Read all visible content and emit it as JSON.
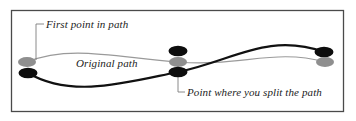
{
  "figure": {
    "name": "path-split-illustration",
    "background_color": "#ffffff",
    "border_color": "#4a4a4a",
    "border": {
      "x": 11,
      "y": 10,
      "width": 333,
      "height": 102
    }
  },
  "annotations": [
    {
      "id": "first-point",
      "text": "First point in path",
      "x": 46,
      "y": 18,
      "leader": "elbow-down-left",
      "points_to": "start-anchor-gray"
    },
    {
      "id": "original-path",
      "text": "Original path",
      "x": 76,
      "y": 57,
      "leader": "none",
      "points_to": "gray-path"
    },
    {
      "id": "split-point",
      "text": "Point where you split the path",
      "x": 187,
      "y": 86,
      "leader": "elbow-up-left",
      "points_to": "split-anchor-black"
    }
  ],
  "paths": [
    {
      "id": "gray-path",
      "label": "Original path",
      "color": "#9a9a9a",
      "stroke_width": 1.1,
      "description": "thin light-gray S-curve running above the black curve on the left half and below it on the right half"
    },
    {
      "id": "black-path",
      "label": "Split path",
      "color": "#111111",
      "stroke_width": 2.1,
      "description": "thick black S-curve running below the gray curve on the left half and above it on the right half"
    }
  ],
  "anchors": [
    {
      "id": "start-anchor-gray",
      "cx": 27,
      "cy": 62,
      "rx": 9,
      "ry": 5,
      "color": "#8f8f8f",
      "group": "start"
    },
    {
      "id": "start-anchor-black",
      "cx": 28,
      "cy": 73,
      "rx": 9,
      "ry": 5,
      "color": "#0d0d0d",
      "group": "start"
    },
    {
      "id": "split-anchor-black-top",
      "cx": 178,
      "cy": 51,
      "rx": 9,
      "ry": 5,
      "color": "#0d0d0d",
      "group": "split"
    },
    {
      "id": "split-anchor-gray",
      "cx": 178,
      "cy": 62,
      "rx": 9,
      "ry": 5,
      "color": "#8f8f8f",
      "group": "split"
    },
    {
      "id": "split-anchor-black",
      "cx": 178,
      "cy": 72,
      "rx": 9,
      "ry": 5,
      "color": "#0d0d0d",
      "group": "split"
    },
    {
      "id": "end-anchor-black",
      "cx": 324,
      "cy": 52,
      "rx": 9,
      "ry": 5,
      "color": "#0d0d0d",
      "group": "end"
    },
    {
      "id": "end-anchor-gray",
      "cx": 325,
      "cy": 62,
      "rx": 9,
      "ry": 5,
      "color": "#8f8f8f",
      "group": "end"
    }
  ],
  "leader_lines": [
    {
      "id": "leader-first-point",
      "color": "#7d7d7d",
      "d": "M 44 24 L 36 24 L 36 60"
    },
    {
      "id": "leader-split-point",
      "color": "#7d7d7d",
      "d": "M 185 92 L 178 92 L 178 76"
    }
  ],
  "colors": {
    "gray_stroke": "#9a9a9a",
    "black_stroke": "#111111",
    "gray_anchor": "#8f8f8f",
    "black_anchor": "#0d0d0d",
    "leader": "#7d7d7d",
    "text": "#1b1b1b",
    "border": "#4a4a4a"
  }
}
